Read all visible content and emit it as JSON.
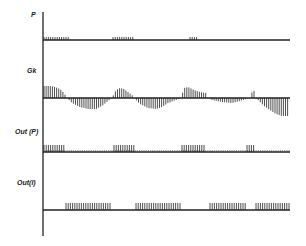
{
  "diagram": {
    "type": "timing-diagram",
    "axis": {
      "x": 43,
      "y_top": 12,
      "y_bottom": 236,
      "x_end": 290
    },
    "channels": [
      {
        "id": "p",
        "label": "P",
        "label_pos": {
          "x": 31,
          "y": 11
        },
        "baseline_y": 40,
        "kind": "pulse-segments",
        "tick_height": 3,
        "segments": [
          [
            44,
            70
          ],
          [
            113,
            133
          ],
          [
            190,
            197
          ]
        ]
      },
      {
        "id": "gk",
        "label": "Gk",
        "label_pos": {
          "x": 27,
          "y": 67
        },
        "baseline_y": 98,
        "kind": "hatched-wave",
        "points": [
          [
            44,
            -12
          ],
          [
            50,
            -12
          ],
          [
            55,
            -11
          ],
          [
            60,
            -9
          ],
          [
            64,
            -5
          ],
          [
            67,
            0
          ],
          [
            72,
            5
          ],
          [
            80,
            9
          ],
          [
            88,
            11
          ],
          [
            96,
            11
          ],
          [
            102,
            8
          ],
          [
            108,
            3
          ],
          [
            112,
            0
          ],
          [
            116,
            -8
          ],
          [
            120,
            -10
          ],
          [
            124,
            -9
          ],
          [
            128,
            -6
          ],
          [
            132,
            -3
          ],
          [
            134,
            0
          ],
          [
            140,
            6
          ],
          [
            148,
            10
          ],
          [
            156,
            11
          ],
          [
            162,
            9
          ],
          [
            168,
            5
          ],
          [
            176,
            2
          ],
          [
            181,
            0
          ],
          [
            184,
            -10
          ],
          [
            188,
            -11
          ],
          [
            194,
            -8
          ],
          [
            200,
            -6
          ],
          [
            206,
            -5
          ],
          [
            208,
            0
          ],
          [
            212,
            2
          ],
          [
            222,
            4
          ],
          [
            232,
            5
          ],
          [
            240,
            3
          ],
          [
            246,
            1
          ],
          [
            250,
            0
          ],
          [
            251,
            -5
          ],
          [
            254,
            -7
          ],
          [
            255,
            0
          ],
          [
            258,
            2
          ],
          [
            264,
            8
          ],
          [
            270,
            12
          ],
          [
            276,
            16
          ],
          [
            282,
            18
          ],
          [
            289,
            18
          ]
        ]
      },
      {
        "id": "out-p",
        "label": "Out (P)",
        "label_pos": {
          "x": 15,
          "y": 128
        },
        "baseline_y": 152,
        "kind": "pulse-segments",
        "tick_height": 7,
        "small_tick_height": 2,
        "segments": [
          [
            44,
            64
          ],
          [
            114,
            134
          ],
          [
            182,
            206
          ],
          [
            247,
            254
          ]
        ]
      },
      {
        "id": "out-i",
        "label": "Out(I)",
        "label_pos": {
          "x": 17,
          "y": 179
        },
        "baseline_y": 210,
        "kind": "pulse-segments",
        "tick_height": 7,
        "small_tick_height": 0,
        "segments": [
          [
            66,
            111
          ],
          [
            136,
            180
          ],
          [
            210,
            247
          ],
          [
            256,
            290
          ]
        ]
      }
    ]
  }
}
